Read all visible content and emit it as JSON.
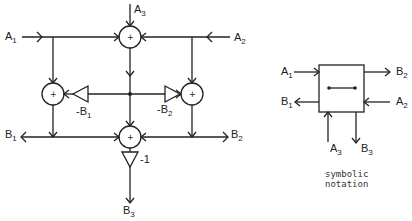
{
  "diagram": {
    "main": {
      "inputs": {
        "a1": {
          "main": "A",
          "sub": "1"
        },
        "a2": {
          "main": "A",
          "sub": "2"
        },
        "a3": {
          "main": "A",
          "sub": "3"
        }
      },
      "outputs": {
        "b1": {
          "main": "B",
          "sub": "1"
        },
        "b2": {
          "main": "B",
          "sub": "2"
        },
        "b3": {
          "main": "B",
          "sub": "3"
        }
      },
      "summers": [
        {
          "id": "top",
          "sign": "+"
        },
        {
          "id": "left",
          "sign": "+"
        },
        {
          "id": "right",
          "sign": "+"
        },
        {
          "id": "bottom",
          "sign": "+"
        }
      ],
      "amplifiers": {
        "left": {
          "main": "-B",
          "sub": "1"
        },
        "right": {
          "main": "-B",
          "sub": "2"
        },
        "bottom": {
          "gain": "-1"
        }
      }
    },
    "symbolic": {
      "inputs": {
        "a1": {
          "main": "A",
          "sub": "1"
        },
        "a2": {
          "main": "A",
          "sub": "2"
        },
        "a3": {
          "main": "A",
          "sub": "3"
        }
      },
      "outputs": {
        "b1": {
          "main": "B",
          "sub": "1"
        },
        "b2": {
          "main": "B",
          "sub": "2"
        },
        "b3": {
          "main": "B",
          "sub": "3"
        }
      },
      "caption_line1": "symbolic",
      "caption_line2": "notation"
    }
  }
}
